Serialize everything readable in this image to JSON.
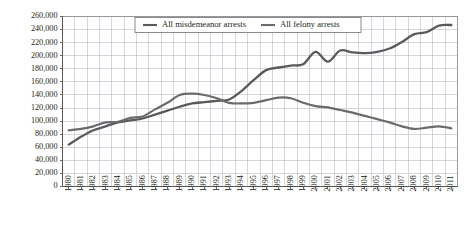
{
  "chart_data": {
    "type": "line",
    "title": "",
    "xlabel": "",
    "ylabel": "",
    "grid": true,
    "legend_position": "top-center",
    "ylim": [
      0,
      260000
    ],
    "ytick_step": 20000,
    "ytick_labels": [
      "0",
      "20,000",
      "40,000",
      "60,000",
      "80,000",
      "100,000",
      "120,000",
      "140,000",
      "160,000",
      "180,000",
      "200,000",
      "220,000",
      "240,000",
      "260,000"
    ],
    "ytick_values": [
      0,
      20000,
      40000,
      60000,
      80000,
      100000,
      120000,
      140000,
      160000,
      180000,
      200000,
      220000,
      240000,
      260000
    ],
    "categories": [
      "1980",
      "1981",
      "1982",
      "1983",
      "1984",
      "1985",
      "1986",
      "1987",
      "1988",
      "1989",
      "1990",
      "1991",
      "1992",
      "1993",
      "1994",
      "1995",
      "1996",
      "1997",
      "1998",
      "1999",
      "2000",
      "2001",
      "2002",
      "2003",
      "2004",
      "2005",
      "2006",
      "2007",
      "2008",
      "2009",
      "2010",
      "2011"
    ],
    "series": [
      {
        "name": "All misdemeanor arrests",
        "color": "#5a5a5c",
        "values": [
          64000,
          76000,
          86000,
          92000,
          98000,
          101000,
          104000,
          110000,
          116000,
          122000,
          127000,
          129000,
          131000,
          133000,
          146000,
          163000,
          178000,
          182000,
          185000,
          187000,
          206000,
          191000,
          208000,
          205000,
          204000,
          206000,
          211000,
          221000,
          233000,
          236000,
          246000,
          247000
        ]
      },
      {
        "name": "All felony arrests",
        "color": "#6b6b6d",
        "values": [
          86000,
          88000,
          92000,
          98000,
          99000,
          105000,
          107000,
          118000,
          128000,
          140000,
          142000,
          140000,
          135000,
          128000,
          127000,
          128000,
          132000,
          136000,
          135000,
          128000,
          123000,
          121000,
          117000,
          113000,
          108000,
          103000,
          98000,
          92000,
          88000,
          90000,
          92000,
          89000
        ]
      }
    ],
    "legend": [
      {
        "label": "All misdemeanor arrests",
        "color": "#5a5a5c"
      },
      {
        "label": "All felony arrests",
        "color": "#6b6b6d"
      }
    ]
  },
  "colors": {
    "background": "#ffffff",
    "grid": "#b9bdc4",
    "axis": "#58595b",
    "text": "#231f20",
    "series_misdemeanor": "#5a5a5c",
    "series_felony": "#6b6b6d"
  }
}
